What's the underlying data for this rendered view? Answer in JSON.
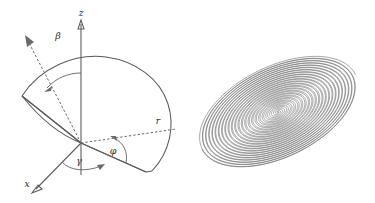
{
  "figure": {
    "background_color": "#ffffff",
    "line_color": "#5e5e5e",
    "label_color": "#2b2b2b"
  },
  "panels": [
    {
      "id": "spherical-sector-diagram",
      "description": "Spherical coordinate sector with angle annotations",
      "origin": {
        "x": 81,
        "y": 143
      },
      "axes": [
        {
          "name": "z-axis",
          "label": "z",
          "label_x": 81,
          "label_y": 15,
          "arrow": true,
          "style": "solid",
          "tip_x": 81,
          "tip_y": 22
        },
        {
          "name": "x-axis",
          "label": "x",
          "label_x": 27,
          "label_y": 186,
          "arrow": true,
          "style": "solid",
          "tip_x": 33,
          "tip_y": 192
        },
        {
          "name": "radius-line",
          "label": "r",
          "label_x": 158,
          "label_y": 123,
          "arrow": false,
          "style": "dashed",
          "tip_x": 177,
          "tip_y": 129
        },
        {
          "name": "beta-direction",
          "label": "",
          "label_x": 0,
          "label_y": 0,
          "arrow": true,
          "style": "dashed",
          "tip_x": 27,
          "tip_y": 41
        }
      ],
      "angles": [
        {
          "name": "beta",
          "symbol": "β",
          "label_x": 58,
          "label_y": 38,
          "between": [
            "z-axis",
            "beta-direction"
          ]
        },
        {
          "name": "gamma",
          "symbol": "γ",
          "label_x": 79,
          "label_y": 163,
          "between": [
            "x-axis",
            "azimuth-line"
          ]
        },
        {
          "name": "phi",
          "symbol": "φ",
          "label_x": 113,
          "label_y": 153,
          "between": [
            "azimuth-line",
            "radius-line"
          ]
        }
      ]
    },
    {
      "id": "spiral-torus-diagram",
      "description": "Nested spiral of tilted concentric ellipses",
      "center": {
        "x": 90,
        "y": 112
      },
      "tilt_degrees": -26,
      "outer_radius_x": 86,
      "outer_radius_y": 46,
      "turns": 23,
      "stroke_color": "#5f5f5f"
    }
  ]
}
